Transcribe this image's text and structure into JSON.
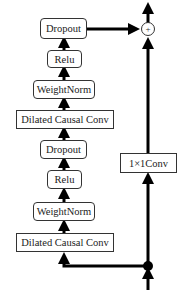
{
  "diagram": {
    "type": "residual-block",
    "left_branch": [
      {
        "id": "dropout_top",
        "label": "Dropout",
        "shape": "rounded"
      },
      {
        "id": "relu_top",
        "label": "Relu",
        "shape": "rounded"
      },
      {
        "id": "weightnorm_top",
        "label": "WeightNorm",
        "shape": "rounded"
      },
      {
        "id": "dilated_conv_top",
        "label": "Dilated Causal Conv",
        "shape": "rect"
      },
      {
        "id": "dropout_bottom",
        "label": "Dropout",
        "shape": "rounded"
      },
      {
        "id": "relu_bottom",
        "label": "Relu",
        "shape": "rounded"
      },
      {
        "id": "weightnorm_bottom",
        "label": "WeightNorm",
        "shape": "rounded"
      },
      {
        "id": "dilated_conv_bottom",
        "label": "Dilated Causal Conv",
        "shape": "rect"
      }
    ],
    "skip_branch": {
      "label": "1×1Conv",
      "shape": "rect"
    },
    "merge": {
      "symbol": "+",
      "shape": "circle"
    },
    "colors": {
      "line": "#000000",
      "box_border": "#333333",
      "text": "#222222",
      "background": "#ffffff"
    }
  }
}
